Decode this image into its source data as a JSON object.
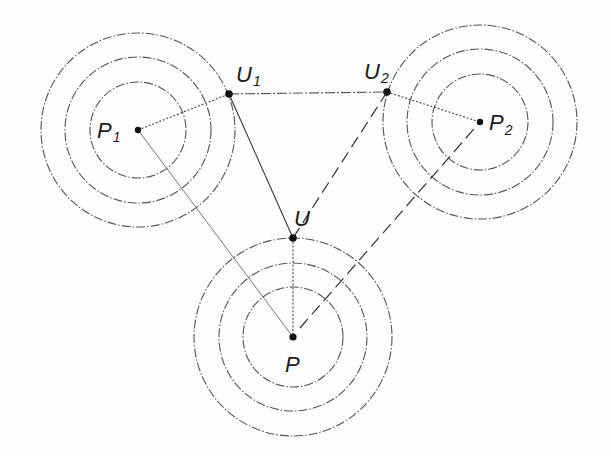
{
  "figure": {
    "type": "geometric-diagram",
    "points": [
      {
        "id": "P1",
        "label": "P",
        "subscript": "1",
        "x": 138,
        "y": 130,
        "label_x": 97,
        "label_y": 138
      },
      {
        "id": "P2",
        "label": "P",
        "subscript": "2",
        "x": 480,
        "y": 122,
        "label_x": 489,
        "label_y": 130
      },
      {
        "id": "P",
        "label": "P",
        "subscript": "",
        "x": 293,
        "y": 337,
        "label_x": 285,
        "label_y": 372
      },
      {
        "id": "U1",
        "label": "U",
        "subscript": "1",
        "x": 229,
        "y": 94,
        "label_x": 236,
        "label_y": 82
      },
      {
        "id": "U2",
        "label": "U",
        "subscript": "2",
        "x": 387,
        "y": 92,
        "label_x": 367,
        "label_y": 78
      },
      {
        "id": "U",
        "label": "U",
        "subscript": "",
        "x": 293,
        "y": 238,
        "label_x": 296,
        "label_y": 226
      }
    ],
    "circle_groups": [
      {
        "center": "P1",
        "cx": 138,
        "cy": 130,
        "radii": [
          48,
          73,
          97
        ]
      },
      {
        "center": "P2",
        "cx": 480,
        "cy": 122,
        "radii": [
          48,
          73,
          97
        ]
      },
      {
        "center": "P",
        "cx": 293,
        "cy": 337,
        "radii": [
          50,
          74,
          99
        ]
      }
    ],
    "segments": [
      {
        "from": "P1",
        "to": "U1",
        "style": "dotted"
      },
      {
        "from": "U1",
        "to": "U2",
        "style": "dashdot"
      },
      {
        "from": "U2",
        "to": "P2",
        "style": "dotted"
      },
      {
        "from": "P1",
        "to": "P",
        "style": "solid-light"
      },
      {
        "from": "U1",
        "to": "U",
        "style": "solid"
      },
      {
        "from": "U",
        "to": "P",
        "style": "dotted"
      },
      {
        "from": "U",
        "to": "U2",
        "style": "dashed"
      },
      {
        "from": "P",
        "to": "P2",
        "style": "dashed"
      }
    ]
  },
  "labels": {
    "P1": {
      "main": "P",
      "sub": "1"
    },
    "P2": {
      "main": "P",
      "sub": "2"
    },
    "P": {
      "main": "P",
      "sub": ""
    },
    "U1": {
      "main": "U",
      "sub": "1"
    },
    "U2": {
      "main": "U",
      "sub": "2"
    },
    "U": {
      "main": "U",
      "sub": ""
    }
  }
}
